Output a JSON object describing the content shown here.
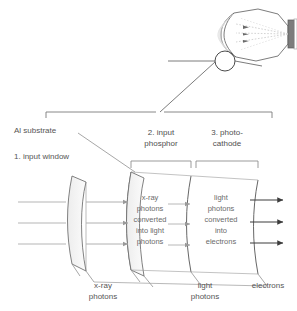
{
  "diagram": {
    "title_absent": true,
    "tube": {
      "name": "image-intensifier-tube",
      "output_window_label_absent": true
    },
    "callout": {
      "marker": "circle",
      "leader": "line-from-circle-to-bracket"
    },
    "sections": [
      {
        "id": "s1",
        "label": "1. input window"
      },
      {
        "id": "s2",
        "label": "2. input\nphosphor",
        "line1": "2. input",
        "line2": "phosphor"
      },
      {
        "id": "s3",
        "label": "3. photo-\ncathode",
        "line1": "3. photo-",
        "line2": "cathode"
      }
    ],
    "annotations": {
      "al_substrate": "Al substrate"
    },
    "process_columns": [
      {
        "id": "phosphor-process",
        "lines": [
          "x-ray",
          "photons",
          "converted",
          "into light",
          "photons"
        ]
      },
      {
        "id": "photocathode-process",
        "lines": [
          "light",
          "photons",
          "converted",
          "into",
          "electrons"
        ]
      }
    ],
    "bottom_labels": [
      {
        "id": "xray-photons",
        "line1": "x-ray",
        "line2": "photons"
      },
      {
        "id": "light-photons",
        "line1": "light",
        "line2": "photons"
      },
      {
        "id": "electrons",
        "line1": "electrons",
        "line2": ""
      }
    ],
    "colors": {
      "stroke": "#5a5a5a",
      "light_stroke": "#b9b9b9",
      "arrow_gray": "#9a9a9a",
      "arrow_dark": "#3c3c3c",
      "plate_fill": "#f2f2f2",
      "tube_dark": "#6e6e6e",
      "text": "#555555",
      "background": "#ffffff"
    }
  }
}
